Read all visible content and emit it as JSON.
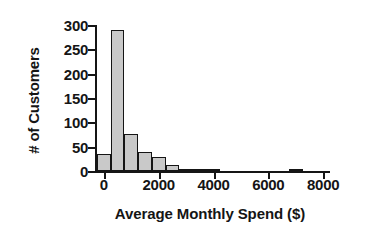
{
  "chart_data": {
    "type": "bar",
    "title": "",
    "subtitle": "",
    "xlabel": "Average Monthly Spend ($)",
    "ylabel": "# of Customers",
    "xlim": [
      -250,
      8250
    ],
    "ylim": [
      0,
      300
    ],
    "grid": false,
    "legend": null,
    "bin_width": 500,
    "x_ticks": [
      0,
      2000,
      4000,
      6000,
      8000
    ],
    "x_tick_labels": [
      "0",
      "2000",
      "4000",
      "6000",
      "8000"
    ],
    "y_ticks": [
      0,
      50,
      100,
      150,
      200,
      250,
      300
    ],
    "y_tick_labels": [
      "0",
      "50",
      "100",
      "150",
      "200",
      "250",
      "300"
    ],
    "bin_starts": [
      -250,
      250,
      750,
      1250,
      1750,
      2250,
      2750,
      3250,
      3750,
      4250,
      4750,
      5250,
      5750,
      6250,
      6750,
      7250
    ],
    "values": [
      35,
      290,
      77,
      40,
      29,
      12,
      3,
      4,
      1,
      0,
      0,
      0,
      0,
      0,
      5,
      0
    ],
    "bar_color": "#c9c9c9",
    "bar_edge_color": "#151515",
    "axis_color": "#151515",
    "background_color": "#ffffff"
  }
}
